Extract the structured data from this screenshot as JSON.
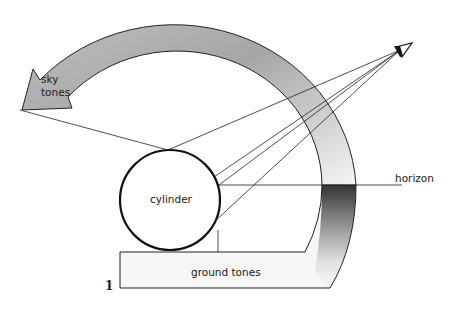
{
  "figure": {
    "number": "1",
    "labels": {
      "sky": [
        "sky",
        "tones"
      ],
      "cylinder": "cylinder",
      "horizon": "horizon",
      "ground": "ground tones",
      "eye": "V"
    }
  },
  "colors": {
    "stroke": "#222222",
    "sky_band_dark": "#a9a9a9",
    "sky_band_light": "#f4f4f4",
    "horizon_dark": "#3a3a3a",
    "ground_light": "#f7f7f7"
  }
}
